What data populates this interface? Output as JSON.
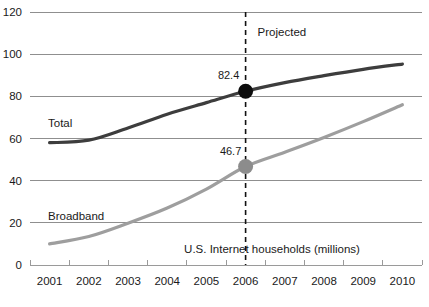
{
  "chart_data": {
    "type": "line",
    "title": "",
    "xlabel": "U.S. Internet households (millions)",
    "ylabel": "",
    "categories": [
      "2001",
      "2002",
      "2003",
      "2004",
      "2005",
      "2006",
      "2007",
      "2008",
      "2009",
      "2010"
    ],
    "ylim": [
      0,
      120
    ],
    "ytick_step": 20,
    "yticks": [
      "0",
      "20",
      "40",
      "60",
      "80",
      "100",
      "120"
    ],
    "grid": true,
    "legend_position": "inline",
    "series": [
      {
        "name": "Total",
        "color": "#3d3d3d",
        "values": [
          58.0,
          59.2,
          65.0,
          71.5,
          77.0,
          82.4,
          86.5,
          89.8,
          92.8,
          95.3
        ]
      },
      {
        "name": "Broadband",
        "color": "#9e9e9e",
        "values": [
          10.0,
          13.5,
          19.8,
          27.0,
          36.0,
          46.7,
          53.5,
          60.5,
          68.0,
          76.0
        ]
      }
    ],
    "annotations": [
      {
        "label": "82.4",
        "series": "Total",
        "category": "2006",
        "value": 82.4,
        "marker": "filled-circle",
        "marker_color": "#0d0d0d"
      },
      {
        "label": "46.7",
        "series": "Broadband",
        "category": "2006",
        "value": 46.7,
        "marker": "filled-circle",
        "marker_color": "#8c8c8c"
      },
      {
        "label": "Projected",
        "category": "2006",
        "kind": "region-label"
      }
    ],
    "divider": {
      "label": "Projected",
      "at_category": "2006",
      "style": "dashed",
      "color": "#111111"
    }
  },
  "labels": {
    "series_total": "Total",
    "series_broadband": "Broadband",
    "projected": "Projected",
    "axis_caption": "U.S. Internet households (millions)",
    "value_total_2006": "82.4",
    "value_broadband_2006": "46.7"
  }
}
